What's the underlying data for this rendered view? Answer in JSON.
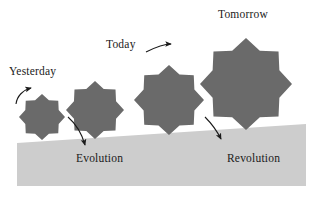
{
  "figure": {
    "title_text_present": false,
    "background_color": "#ffffff",
    "star_fill_color": "#6a6a6a",
    "ground_fill_color": "#cdcdcd",
    "ink_color": "#1a1a1a"
  },
  "labels": {
    "yesterday": "Yesterday",
    "today": "Today",
    "tomorrow": "Tomorrow",
    "evolution": "Evolution",
    "revolution": "Revolution"
  },
  "stars": [
    {
      "name": "star-1-yesterday",
      "cx": 42,
      "cy": 117,
      "r": 23,
      "points": 8
    },
    {
      "name": "star-2",
      "cx": 95,
      "cy": 110,
      "r": 29,
      "points": 8
    },
    {
      "name": "star-3-today",
      "cx": 169,
      "cy": 100,
      "r": 35,
      "points": 8
    },
    {
      "name": "star-4-tomorrow",
      "cx": 246,
      "cy": 84,
      "r": 46,
      "points": 8
    }
  ],
  "ground": {
    "name": "ground-slope",
    "left_x": 17,
    "right_x": 306,
    "bottom_y": 186,
    "left_top_y": 143,
    "right_top_y": 124
  },
  "arrows": [
    {
      "name": "arrow-to-yesterday",
      "x1": 16,
      "y1": 104,
      "x2": 33,
      "y2": 87,
      "curve": "up-right"
    },
    {
      "name": "arrow-to-evolution",
      "x1": 68,
      "y1": 117,
      "x2": 86,
      "y2": 147,
      "curve": "down-right"
    },
    {
      "name": "arrow-to-today",
      "x1": 146,
      "y1": 52,
      "x2": 173,
      "y2": 44,
      "curve": "right"
    },
    {
      "name": "arrow-to-revolution",
      "x1": 205,
      "y1": 117,
      "x2": 223,
      "y2": 141,
      "curve": "down-right"
    }
  ]
}
